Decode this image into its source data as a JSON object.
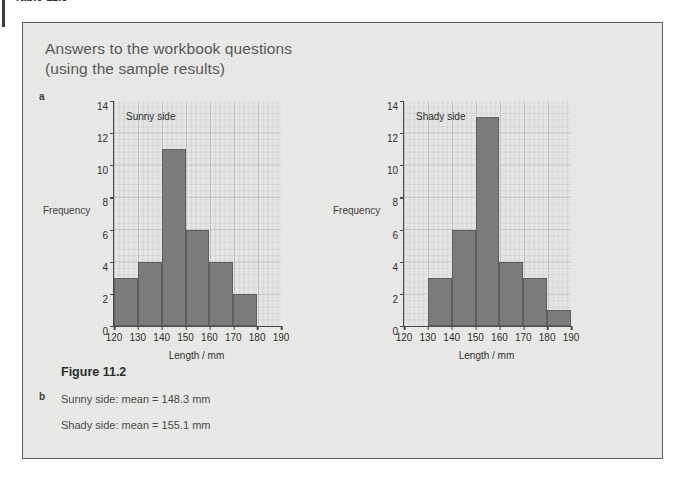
{
  "page": {
    "running_head": "Table 11.3"
  },
  "answer_box": {
    "title_line1": "Answers to the workbook questions",
    "title_line2": "(using the sample results)",
    "part_a_letter": "a",
    "part_b_letter": "b",
    "figure_caption": "Figure 11.2",
    "answer_sunny": "Sunny side: mean = 148.3 mm",
    "answer_shady": "Shady side: mean = 155.1 mm"
  },
  "colors": {
    "bar_fill": "#7c7c7c",
    "bar_stroke": "#5f5f5f",
    "box_background": "#e9e9e7",
    "box_border": "#5d5d5d",
    "axis": "#4a4a4a",
    "title_text": "#58585a"
  },
  "chart_data": [
    {
      "type": "bar",
      "title": "Sunny side",
      "xlabel": "Length / mm",
      "ylabel": "Frequency",
      "bin_width": 10,
      "bin_edges": [
        120,
        130,
        140,
        150,
        160,
        170,
        180,
        190
      ],
      "categories": [
        "120-130",
        "130-140",
        "140-150",
        "150-160",
        "160-170",
        "170-180",
        "180-190"
      ],
      "values": [
        3,
        4,
        11,
        6,
        4,
        2,
        0
      ],
      "xlim": [
        120,
        190
      ],
      "ylim": [
        0,
        14
      ],
      "xticks": [
        120,
        130,
        140,
        150,
        160,
        170,
        180,
        190
      ],
      "yticks": [
        0,
        2,
        4,
        6,
        8,
        10,
        12,
        14
      ],
      "grid": true,
      "legend": "none",
      "mean": 148.3,
      "mean_units": "mm"
    },
    {
      "type": "bar",
      "title": "Shady side",
      "xlabel": "Length / mm",
      "ylabel": "Frequency",
      "bin_width": 10,
      "bin_edges": [
        120,
        130,
        140,
        150,
        160,
        170,
        180,
        190
      ],
      "categories": [
        "120-130",
        "130-140",
        "140-150",
        "150-160",
        "160-170",
        "170-180",
        "180-190"
      ],
      "values": [
        0,
        3,
        6,
        13,
        4,
        3,
        1
      ],
      "xlim": [
        120,
        190
      ],
      "ylim": [
        0,
        14
      ],
      "xticks": [
        120,
        130,
        140,
        150,
        160,
        170,
        180,
        190
      ],
      "yticks": [
        0,
        2,
        4,
        6,
        8,
        10,
        12,
        14
      ],
      "grid": true,
      "legend": "none",
      "mean": 155.1,
      "mean_units": "mm"
    }
  ]
}
